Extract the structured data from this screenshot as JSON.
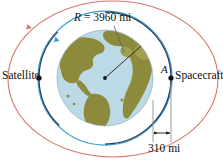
{
  "figure": {
    "type": "orbital-diagram",
    "title_text": "",
    "background_color": "#ffffff"
  },
  "labels": {
    "radius_symbol": "R",
    "radius_equals": " = 3960 mi",
    "radius_full": "R = 3960 mi",
    "radius_value": 3960,
    "radius_units": "mi",
    "satellite": "Satellite",
    "spacecraft": "Spacecraft",
    "point_a": "A",
    "altitude_full": "310 mi",
    "altitude_value": 310,
    "altitude_units": "mi"
  },
  "geometry": {
    "earth_center_x": 105,
    "earth_center_y": 78,
    "earth_radius_px": 48,
    "spacecraft_orbit_radius_px": 58,
    "satellite_orbit_radius_px": 73,
    "outer_ellipse_rx": 89,
    "outer_ellipse_ry": 80,
    "satellite_dot_x": 39,
    "satellite_dot_y": 78,
    "spacecraft_dot_x": 171,
    "spacecraft_dot_y": 78,
    "dimension_left_x": 153,
    "dimension_right_x": 171,
    "dimension_arrow_y": 133
  },
  "colors": {
    "ocean": "#bcd9e6",
    "land": "#8d8a3c",
    "land_light": "#a39f4e",
    "earth_outline": "#8aa9b8",
    "spacecraft_orbit": "#1f3b5c",
    "satellite_orbit": "#3a9bd1",
    "outer_ellipse": "#d4786a",
    "dimension_line": "#9a9a9a",
    "radius_line": "#1a1a1a",
    "text": "#111111",
    "dot_fill": "#101010"
  }
}
